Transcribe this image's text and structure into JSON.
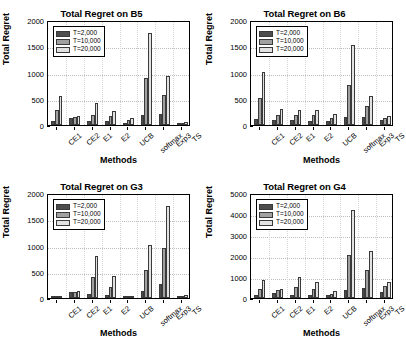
{
  "figure": {
    "series_colors": [
      "#4d4d4d",
      "#a0a0a0",
      "#e2e2e2"
    ],
    "legend_labels": [
      "T=2,000",
      "T=10,000",
      "T=20,000"
    ],
    "xlabel": "Methods",
    "ylabel": "Total Regret",
    "categories": [
      "CE1",
      "CE2",
      "E1",
      "E2",
      "UCB",
      "softmax",
      "Exp3",
      "TS"
    ]
  },
  "chart_data": [
    {
      "type": "bar",
      "title": "Total Regret on B5",
      "xlabel": "Methods",
      "ylabel": "Total Regret",
      "categories": [
        "CE1",
        "CE2",
        "E1",
        "E2",
        "UCB",
        "softmax",
        "Exp3",
        "TS"
      ],
      "series": [
        {
          "name": "T=2,000",
          "values": [
            75,
            140,
            85,
            75,
            45,
            200,
            215,
            25
          ]
        },
        {
          "name": "T=10,000",
          "values": [
            290,
            155,
            185,
            175,
            90,
            905,
            570,
            45
          ]
        },
        {
          "name": "T=20,000",
          "values": [
            550,
            165,
            415,
            270,
            130,
            1760,
            940,
            65
          ]
        }
      ],
      "ylim": [
        0,
        2000
      ],
      "yticks": [
        0,
        500,
        1000,
        1500,
        2000
      ],
      "grid": true,
      "legend_position": "top-left"
    },
    {
      "type": "bar",
      "title": "Total Regret on B6",
      "xlabel": "Methods",
      "ylabel": "Total Regret",
      "categories": [
        "CE1",
        "CE2",
        "E1",
        "E2",
        "UCB",
        "softmax",
        "Exp3",
        "TS"
      ],
      "series": [
        {
          "name": "T=2,000",
          "values": [
            110,
            105,
            90,
            80,
            70,
            150,
            145,
            90
          ]
        },
        {
          "name": "T=10,000",
          "values": [
            515,
            195,
            185,
            185,
            125,
            765,
            365,
            130
          ]
        },
        {
          "name": "T=20,000",
          "values": [
            1015,
            300,
            285,
            290,
            205,
            1530,
            550,
            175
          ]
        }
      ],
      "ylim": [
        0,
        2000
      ],
      "yticks": [
        0,
        500,
        1000,
        1500,
        2000
      ],
      "grid": true,
      "legend_position": "top-left"
    },
    {
      "type": "bar",
      "title": "Total Regret on G3",
      "xlabel": "Methods",
      "ylabel": "Total Regret",
      "categories": [
        "CE1",
        "CE2",
        "E1",
        "E2",
        "UCB",
        "softmax",
        "Exp3",
        "TS"
      ],
      "series": [
        {
          "name": "T=2,000",
          "values": [
            35,
            115,
            80,
            50,
            20,
            140,
            270,
            35
          ]
        },
        {
          "name": "T=10,000",
          "values": [
            40,
            120,
            405,
            210,
            25,
            525,
            950,
            45
          ]
        },
        {
          "name": "T=20,000",
          "values": [
            45,
            125,
            805,
            415,
            30,
            1015,
            1760,
            60
          ]
        }
      ],
      "ylim": [
        0,
        2000
      ],
      "yticks": [
        0,
        500,
        1000,
        1500,
        2000
      ],
      "grid": true,
      "legend_position": "top-left"
    },
    {
      "type": "bar",
      "title": "Total Regret on G4",
      "xlabel": "Methods",
      "ylabel": "Total Regret",
      "categories": [
        "CE1",
        "CE2",
        "E1",
        "E2",
        "UCB",
        "softmax",
        "Exp3",
        "TS"
      ],
      "series": [
        {
          "name": "T=2,000",
          "values": [
            140,
            250,
            145,
            165,
            150,
            400,
            460,
            280
          ]
        },
        {
          "name": "T=10,000",
          "values": [
            450,
            370,
            540,
            450,
            200,
            2060,
            1320,
            570
          ]
        },
        {
          "name": "T=20,000",
          "values": [
            875,
            440,
            1020,
            760,
            330,
            4200,
            2240,
            740
          ]
        }
      ],
      "ylim": [
        0,
        5000
      ],
      "yticks": [
        0,
        1000,
        2000,
        3000,
        4000,
        5000
      ],
      "grid": true,
      "legend_position": "top-left"
    }
  ]
}
